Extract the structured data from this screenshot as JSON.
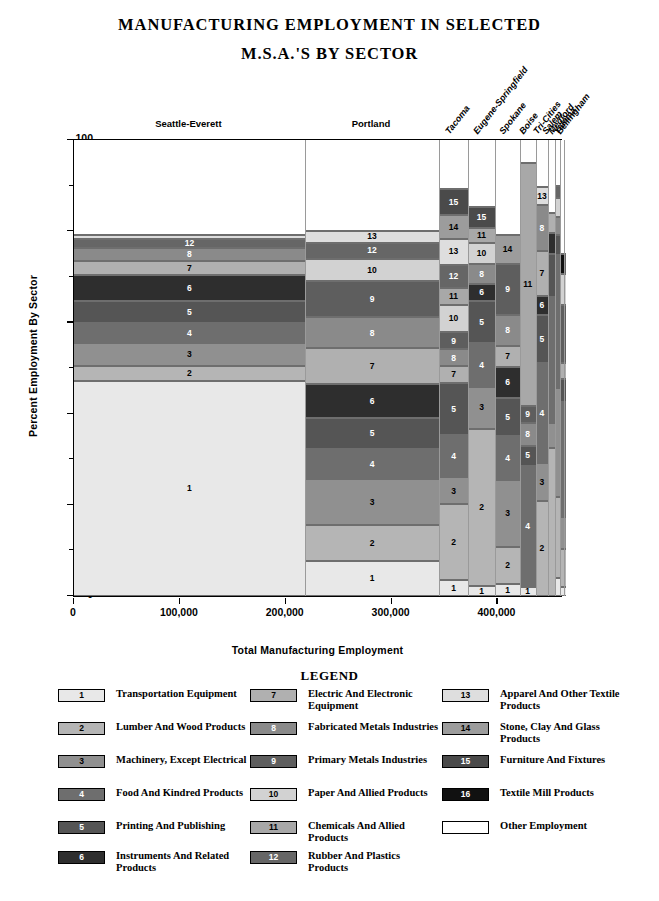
{
  "title_lines": [
    "MANUFACTURING  EMPLOYMENT  IN  SELECTED",
    "M.S.A.'S  BY  SECTOR"
  ],
  "axes": {
    "ylabel": "Percent Employment By Sector",
    "xlabel": "Total Manufacturing Employment",
    "yticks": [
      "0",
      "20",
      "40",
      "60",
      "80",
      "100"
    ],
    "xticks": [
      "0",
      "100,000",
      "200,000",
      "300,000",
      "400,000"
    ]
  },
  "legend": {
    "title": "LEGEND",
    "entries": [
      {
        "key": "1",
        "label": "Transportation Equipment",
        "color": "#e8e8e8"
      },
      {
        "key": "2",
        "label": "Lumber And Wood Products",
        "color": "#b5b5b5"
      },
      {
        "key": "3",
        "label": "Machinery, Except Electrical",
        "color": "#909090"
      },
      {
        "key": "4",
        "label": "Food And Kindred Products",
        "color": "#6e6e6e"
      },
      {
        "key": "5",
        "label": "Printing And Publishing",
        "color": "#555555"
      },
      {
        "key": "6",
        "label": "Instruments And Related Products",
        "color": "#2e2e2e"
      },
      {
        "key": "7",
        "label": "Electric And Electronic Equipment",
        "color": "#b0b0b0"
      },
      {
        "key": "8",
        "label": "Fabricated Metals Industries",
        "color": "#8a8a8a"
      },
      {
        "key": "9",
        "label": "Primary Metals Industries",
        "color": "#5e5e5e"
      },
      {
        "key": "10",
        "label": "Paper And Allied Products",
        "color": "#d2d2d2"
      },
      {
        "key": "11",
        "label": "Chemicals And Allied Products",
        "color": "#a8a8a8"
      },
      {
        "key": "12",
        "label": "Rubber And Plastics Products",
        "color": "#666666"
      },
      {
        "key": "13",
        "label": "Apparel And Other Textile Products",
        "color": "#dedede"
      },
      {
        "key": "14",
        "label": "Stone, Clay And Glass Products",
        "color": "#9c9c9c"
      },
      {
        "key": "15",
        "label": "Furniture And Fixtures",
        "color": "#4a4a4a"
      },
      {
        "key": "16",
        "label": "Textile Mill Products",
        "color": "#111111"
      },
      {
        "key": "",
        "label": "Other Employment",
        "color": "#ffffff"
      }
    ]
  },
  "chart_data": {
    "type": "bar",
    "subtype": "stacked-100-percent-variable-width",
    "title": "MANUFACTURING EMPLOYMENT IN SELECTED M.S.A.'S BY SECTOR",
    "xlabel": "Total Manufacturing Employment",
    "ylabel": "Percent Employment By Sector",
    "xlim": [
      0,
      460000
    ],
    "ylim": [
      0,
      100
    ],
    "grid": false,
    "legend_position": "bottom",
    "note": "Column width is proportional to total manufacturing employment; segment height is percent of that M.S.A.'s employment.",
    "columns": [
      {
        "name": "Seattle-Everett",
        "label_position": "top-horizontal",
        "x_start": 0,
        "x_end": 218000,
        "total_employment": 218000,
        "segments": [
          {
            "key": "1",
            "value": 47.2
          },
          {
            "key": "2",
            "value": 3.3
          },
          {
            "key": "3",
            "value": 5.0
          },
          {
            "key": "4",
            "value": 4.3
          },
          {
            "key": "5",
            "value": 4.8
          },
          {
            "key": "6",
            "value": 5.7
          },
          {
            "key": "7",
            "value": 3.1
          },
          {
            "key": "8",
            "value": 2.9
          },
          {
            "key": "12",
            "value": 2.0
          },
          {
            "key": "13",
            "value": 0.9
          },
          {
            "key": "",
            "value": 20.8
          }
        ]
      },
      {
        "name": "Portland",
        "label_position": "top-horizontal",
        "x_start": 218000,
        "x_end": 345000,
        "total_employment": 127000,
        "segments": [
          {
            "key": "1",
            "value": 7.6
          },
          {
            "key": "2",
            "value": 7.9
          },
          {
            "key": "3",
            "value": 10.1
          },
          {
            "key": "4",
            "value": 6.6
          },
          {
            "key": "5",
            "value": 6.8
          },
          {
            "key": "6",
            "value": 7.4
          },
          {
            "key": "7",
            "value": 7.9
          },
          {
            "key": "8",
            "value": 6.8
          },
          {
            "key": "9",
            "value": 7.9
          },
          {
            "key": "10",
            "value": 5.0
          },
          {
            "key": "12",
            "value": 3.5
          },
          {
            "key": "13",
            "value": 2.6
          },
          {
            "key": "",
            "value": 19.9
          }
        ]
      },
      {
        "name": "Tacoma",
        "label_position": "top-rotated",
        "x_start": 345000,
        "x_end": 372000,
        "total_employment": 27000,
        "segments": [
          {
            "key": "1",
            "value": 3.5
          },
          {
            "key": "2",
            "value": 16.6
          },
          {
            "key": "3",
            "value": 5.9
          },
          {
            "key": "4",
            "value": 9.4
          },
          {
            "key": "5",
            "value": 11.3
          },
          {
            "key": "7",
            "value": 3.7
          },
          {
            "key": "8",
            "value": 3.7
          },
          {
            "key": "9",
            "value": 3.7
          },
          {
            "key": "10",
            "value": 6.1
          },
          {
            "key": "11",
            "value": 3.7
          },
          {
            "key": "12",
            "value": 5.1
          },
          {
            "key": "13",
            "value": 5.7
          },
          {
            "key": "14",
            "value": 5.1
          },
          {
            "key": "15",
            "value": 5.7
          },
          {
            "key": "",
            "value": 10.8
          }
        ]
      },
      {
        "name": "Eugene-Springfield",
        "label_position": "top-rotated",
        "x_start": 372000,
        "x_end": 398000,
        "total_employment": 26000,
        "segments": [
          {
            "key": "1",
            "value": 2.2
          },
          {
            "key": "2",
            "value": 34.5
          },
          {
            "key": "3",
            "value": 9.2
          },
          {
            "key": "4",
            "value": 9.6
          },
          {
            "key": "5",
            "value": 9.2
          },
          {
            "key": "6",
            "value": 3.7
          },
          {
            "key": "8",
            "value": 4.4
          },
          {
            "key": "10",
            "value": 4.6
          },
          {
            "key": "11",
            "value": 3.3
          },
          {
            "key": "15",
            "value": 4.6
          },
          {
            "key": "",
            "value": 14.7
          }
        ]
      },
      {
        "name": "Spokane",
        "label_position": "top-rotated",
        "x_start": 398000,
        "x_end": 421000,
        "total_employment": 23000,
        "segments": [
          {
            "key": "1",
            "value": 2.6
          },
          {
            "key": "2",
            "value": 8.1
          },
          {
            "key": "3",
            "value": 14.7
          },
          {
            "key": "4",
            "value": 9.6
          },
          {
            "key": "5",
            "value": 8.5
          },
          {
            "key": "6",
            "value": 6.8
          },
          {
            "key": "7",
            "value": 4.6
          },
          {
            "key": "8",
            "value": 6.8
          },
          {
            "key": "9",
            "value": 11.1
          },
          {
            "key": "14",
            "value": 6.3
          },
          {
            "key": "",
            "value": 20.9
          }
        ]
      },
      {
        "name": "Boise",
        "label_position": "top-rotated",
        "x_start": 421000,
        "x_end": 436000,
        "total_employment": 15000,
        "segments": [
          {
            "key": "1",
            "value": 2.0
          },
          {
            "key": "4",
            "value": 26.6
          },
          {
            "key": "5",
            "value": 4.4
          },
          {
            "key": "8",
            "value": 5.0
          },
          {
            "key": "9",
            "value": 3.7
          },
          {
            "key": "11",
            "value": 53.3
          },
          {
            "key": "",
            "value": 5.0
          }
        ]
      },
      {
        "name": "Tri-Cities",
        "label_position": "top-rotated",
        "x_start": 436000,
        "x_end": 448000,
        "total_employment": 12000,
        "segments": [
          {
            "key": "2",
            "value": 20.9
          },
          {
            "key": "3",
            "value": 8.3
          },
          {
            "key": "4",
            "value": 21.8
          },
          {
            "key": "5",
            "value": 10.7
          },
          {
            "key": "6",
            "value": 4.2
          },
          {
            "key": "7",
            "value": 9.8
          },
          {
            "key": "8",
            "value": 10.0
          },
          {
            "key": "13",
            "value": 3.9
          },
          {
            "key": "",
            "value": 10.4
          }
        ]
      },
      {
        "name": "Salem",
        "label_position": "top-rotated",
        "x_start": 448000,
        "x_end": 454000,
        "total_employment": 6000,
        "segments": [
          {
            "key": "2",
            "value": 32.5
          },
          {
            "key": "3",
            "value": 5.5
          },
          {
            "key": "4",
            "value": 27.5
          },
          {
            "key": "5",
            "value": 9.6
          },
          {
            "key": "6",
            "value": 4.4
          },
          {
            "key": "7",
            "value": 4.4
          },
          {
            "key": "",
            "value": 16.1
          }
        ]
      },
      {
        "name": "Medford",
        "label_position": "top-rotated",
        "x_start": 454000,
        "x_end": 459000,
        "total_employment": 5000,
        "segments": [
          {
            "key": "1",
            "value": 3.9
          },
          {
            "key": "2",
            "value": 17.9
          },
          {
            "key": "3",
            "value": 23.8
          },
          {
            "key": "4",
            "value": 29.2
          },
          {
            "key": "5",
            "value": 4.4
          },
          {
            "key": "8",
            "value": 3.9
          },
          {
            "key": "10",
            "value": 4.2
          },
          {
            "key": "12",
            "value": 2.6
          },
          {
            "key": "",
            "value": 10.1
          }
        ]
      },
      {
        "name": "Yakima",
        "label_position": "top-rotated",
        "x_start": 459000,
        "x_end": 462500,
        "total_employment": 3500,
        "segments": [
          {
            "key": "1",
            "value": 2.0
          },
          {
            "key": "2",
            "value": 8.3
          },
          {
            "key": "3",
            "value": 7.0
          },
          {
            "key": "4",
            "value": 25.2
          },
          {
            "key": "5",
            "value": 5.0
          },
          {
            "key": "7",
            "value": 3.5
          },
          {
            "key": "9",
            "value": 12.9
          },
          {
            "key": "10",
            "value": 6.8
          },
          {
            "key": "16",
            "value": 4.4
          },
          {
            "key": "",
            "value": 24.9
          }
        ]
      },
      {
        "name": "Bellingham",
        "label_position": "top-rotated",
        "x_start": 462500,
        "x_end": 465000,
        "total_employment": 2500,
        "segments": [
          {
            "key": "1",
            "value": 2.0
          },
          {
            "key": "2",
            "value": 8.3
          },
          {
            "key": "3",
            "value": 7.0
          },
          {
            "key": "4",
            "value": 25.2
          },
          {
            "key": "5",
            "value": 5.0
          },
          {
            "key": "7",
            "value": 3.5
          },
          {
            "key": "9",
            "value": 12.9
          },
          {
            "key": "10",
            "value": 6.8
          },
          {
            "key": "12",
            "value": 4.4
          },
          {
            "key": "",
            "value": 24.9
          }
        ]
      }
    ]
  }
}
